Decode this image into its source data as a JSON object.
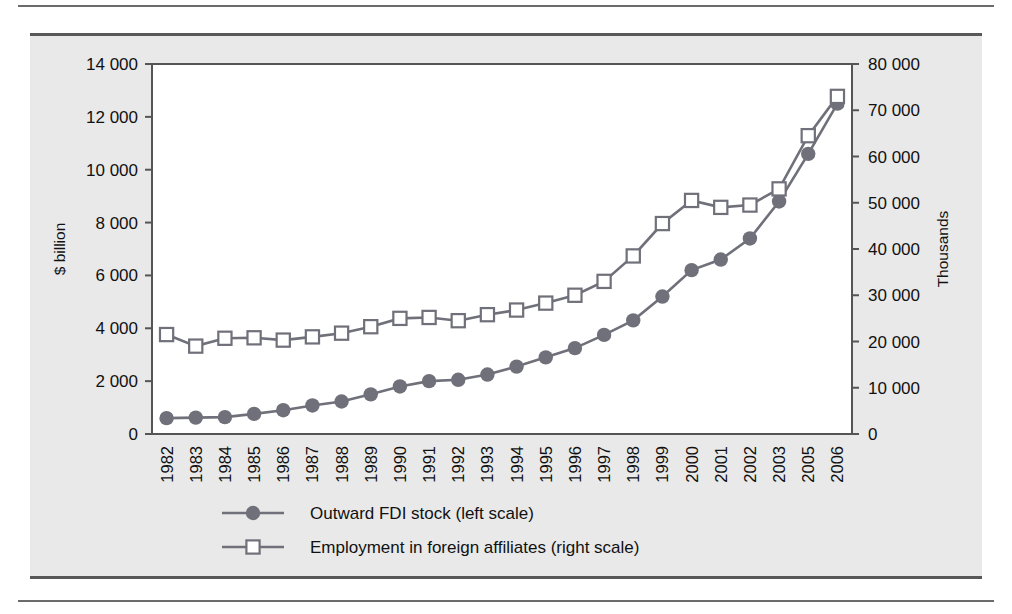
{
  "figure": {
    "panel_bg": "#e9e9e9",
    "rule_color": "#6b6b6b",
    "series_color": "#70707a",
    "marker_open_fill": "#ffffff"
  },
  "chart_data": {
    "type": "line",
    "title": "",
    "subtitle": "",
    "xlabel": "",
    "ylabel": "$ billion",
    "y2label": "Thousands",
    "grid": true,
    "grid_axis": "y",
    "legend_position": "bottom",
    "ylim": [
      0,
      14000
    ],
    "y2lim": [
      0,
      80000
    ],
    "yticks": [
      "0",
      "2 000",
      "4 000",
      "6 000",
      "8 000",
      "10 000",
      "12 000",
      "14 000"
    ],
    "ytick_values": [
      0,
      2000,
      4000,
      6000,
      8000,
      10000,
      12000,
      14000
    ],
    "y2ticks": [
      "0",
      "10 000",
      "20 000",
      "30 000",
      "40 000",
      "50 000",
      "60 000",
      "70 000",
      "80 000"
    ],
    "y2tick_values": [
      0,
      10000,
      20000,
      30000,
      40000,
      50000,
      60000,
      70000,
      80000
    ],
    "categories": [
      "1982",
      "1983",
      "1984",
      "1985",
      "1986",
      "1987",
      "1988",
      "1989",
      "1990",
      "1991",
      "1992",
      "1993",
      "1994",
      "1995",
      "1996",
      "1997",
      "1998",
      "1999",
      "2000",
      "2001",
      "2002",
      "2003",
      "2005",
      "2006"
    ],
    "series": [
      {
        "name": "Outward FDI stock (left scale)",
        "axis": "left",
        "marker": "filled-circle",
        "unit": "$ billion",
        "values": [
          600,
          620,
          640,
          760,
          900,
          1080,
          1230,
          1500,
          1800,
          2000,
          2050,
          2250,
          2550,
          2900,
          3250,
          3750,
          4300,
          5200,
          6200,
          6600,
          7400,
          8800,
          10600,
          12500
        ]
      },
      {
        "name": "Employment in foreign affiliates (right scale)",
        "axis": "right",
        "marker": "open-square",
        "unit": "Thousands",
        "values": [
          21500,
          19000,
          20700,
          20800,
          20300,
          21000,
          21800,
          23200,
          25000,
          25200,
          24500,
          25800,
          26800,
          28300,
          30000,
          33000,
          38500,
          45500,
          50500,
          49000,
          49500,
          53000,
          64500,
          73000
        ]
      }
    ]
  },
  "axis": {
    "left_title": "$ billion",
    "right_title": "Thousands"
  },
  "legend": {
    "items": [
      {
        "label": "Outward FDI stock (left scale)",
        "marker": "filled-circle"
      },
      {
        "label": "Employment in foreign affiliates (right scale)",
        "marker": "open-square"
      }
    ]
  }
}
